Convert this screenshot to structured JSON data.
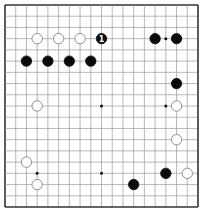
{
  "board": {
    "size": 19,
    "background": "#ffffff",
    "line_color": "#999999",
    "border_color": "#333333",
    "star_points": [
      [
        3,
        3
      ],
      [
        3,
        9
      ],
      [
        3,
        15
      ],
      [
        9,
        3
      ],
      [
        9,
        9
      ],
      [
        9,
        15
      ],
      [
        15,
        3
      ],
      [
        15,
        9
      ],
      [
        15,
        15
      ]
    ],
    "visible_star_points": [
      [
        3,
        15
      ],
      [
        9,
        9
      ],
      [
        9,
        15
      ],
      [
        15,
        3
      ],
      [
        15,
        9
      ]
    ]
  },
  "stones": [
    {
      "color": "white",
      "col": 3,
      "row": 3
    },
    {
      "color": "white",
      "col": 5,
      "row": 3
    },
    {
      "color": "white",
      "col": 7,
      "row": 3
    },
    {
      "color": "black",
      "col": 9,
      "row": 3,
      "label": "1"
    },
    {
      "color": "black",
      "col": 14,
      "row": 3
    },
    {
      "color": "black",
      "col": 16,
      "row": 3
    },
    {
      "color": "black",
      "col": 2,
      "row": 5
    },
    {
      "color": "black",
      "col": 4,
      "row": 5
    },
    {
      "color": "black",
      "col": 6,
      "row": 5
    },
    {
      "color": "black",
      "col": 8,
      "row": 5
    },
    {
      "color": "black",
      "col": 16,
      "row": 7
    },
    {
      "color": "white",
      "col": 3,
      "row": 9
    },
    {
      "color": "white",
      "col": 16,
      "row": 9
    },
    {
      "color": "white",
      "col": 16,
      "row": 12
    },
    {
      "color": "white",
      "col": 2,
      "row": 14
    },
    {
      "color": "black",
      "col": 15,
      "row": 15
    },
    {
      "color": "white",
      "col": 17,
      "row": 15
    },
    {
      "color": "white",
      "col": 3,
      "row": 16
    },
    {
      "color": "black",
      "col": 12,
      "row": 16
    }
  ]
}
